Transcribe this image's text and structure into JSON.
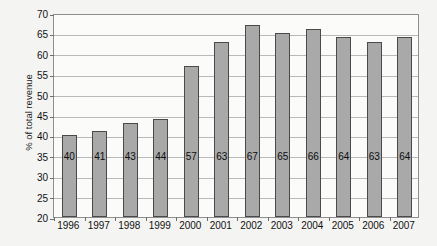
{
  "chart_data": {
    "type": "bar",
    "title": "",
    "xlabel": "",
    "ylabel": "% of total revenue",
    "categories": [
      "1996",
      "1997",
      "1998",
      "1999",
      "2000",
      "2001",
      "2002",
      "2003",
      "2004",
      "2005",
      "2006",
      "2007"
    ],
    "values": [
      40,
      41,
      43,
      44,
      57,
      63,
      67,
      65,
      66,
      64,
      63,
      64
    ],
    "data_labels": [
      "40",
      "41",
      "43",
      "44",
      "57",
      "63",
      "67",
      "65",
      "66",
      "64",
      "63",
      "64"
    ],
    "ylim": [
      20,
      70
    ],
    "ytick_labels": [
      "70",
      "65",
      "60",
      "55",
      "50",
      "45",
      "40",
      "35",
      "30",
      "25",
      "20"
    ],
    "ytick_values": [
      70,
      65,
      60,
      55,
      50,
      45,
      40,
      35,
      30,
      25,
      20
    ],
    "grid": true,
    "legend": null,
    "colors": {
      "bar_fill": "#a9a9a9",
      "bar_border": "#4a4a4a",
      "gridline": "#b9b9b9",
      "plot_border": "#8f8f8f",
      "plot_background": "#fbfbfa",
      "page_background": "#f4f4f2",
      "text": "#111111"
    }
  }
}
